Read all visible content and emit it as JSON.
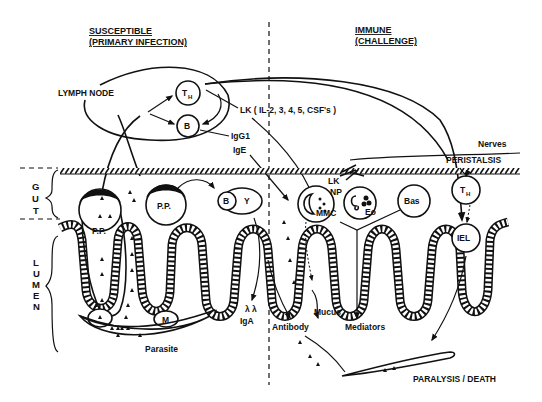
{
  "diagram": {
    "type": "immunology-schematic",
    "sections": {
      "left": {
        "title_line1": "SUSCEPTIBLE",
        "title_line2": "(PRIMARY INFECTION)"
      },
      "right": {
        "title_line1": "IMMUNE",
        "title_line2": "(CHALLENGE)"
      }
    },
    "regions": {
      "gut": {
        "letters": [
          "G",
          "U",
          "T"
        ]
      },
      "lumen": {
        "letters": [
          "L",
          "U",
          "M",
          "E",
          "N"
        ]
      }
    },
    "labels": {
      "lymph_node": "LYMPH NODE",
      "th": "T",
      "th_sub": "H",
      "b": "B",
      "lk_cytokines": "LK ( IL-2, 3, 4, 5, CSF's )",
      "igg1": "IgG1",
      "ige": "IgE",
      "nerves": "Nerves",
      "peristalsis": "PERISTALSIS",
      "pp": "P.P.",
      "m": "M",
      "lk": "LK",
      "np": "NP",
      "mmc": "MMC",
      "eo": "Eo",
      "bas": "Bas",
      "iel": "IEL",
      "iga": "IgA",
      "antibody": "Antibody",
      "mucus": "Mucus",
      "mediators": "Mediators",
      "parasite": "Parasite",
      "outcome": "PARALYSIS / DEATH"
    },
    "nodes": [
      {
        "id": "lymph-node",
        "label": "LYMPH NODE"
      },
      {
        "id": "th-node",
        "label": "TH"
      },
      {
        "id": "b-node",
        "label": "B"
      },
      {
        "id": "peyers-patch-1",
        "label": "P.P."
      },
      {
        "id": "peyers-patch-2",
        "label": "P.P."
      },
      {
        "id": "m-cell",
        "label": "M"
      },
      {
        "id": "b-gut",
        "label": "B"
      },
      {
        "id": "mast-cell",
        "label": "MMC"
      },
      {
        "id": "eosinophil",
        "label": "Eo"
      },
      {
        "id": "basophil",
        "label": "Bas"
      },
      {
        "id": "th-gut",
        "label": "TH"
      },
      {
        "id": "iel",
        "label": "IEL"
      },
      {
        "id": "parasite-left",
        "label": "Parasite"
      },
      {
        "id": "parasite-right",
        "label": "PARALYSIS / DEATH"
      }
    ],
    "edges": [
      {
        "from": "peyers-patch-1",
        "to": "lymph-node"
      },
      {
        "from": "th-node",
        "to": "b-node"
      },
      {
        "from": "th-node",
        "to": "mast-cell",
        "label": "LK ( IL-2, 3, 4, 5, CSF's )"
      },
      {
        "from": "b-node",
        "to": "lumen",
        "label": "IgG1"
      },
      {
        "from": "b-node",
        "to": "mast-cell",
        "label": "IgE"
      },
      {
        "from": "lymph-node",
        "to": "th-gut"
      },
      {
        "from": "lymph-node",
        "to": "iel"
      },
      {
        "from": "th-gut",
        "to": "iel"
      },
      {
        "from": "peyers-patch-2",
        "to": "b-gut"
      },
      {
        "from": "b-gut",
        "to": "lumen",
        "label": "IgA"
      },
      {
        "from": "mast-cell",
        "to": "lumen",
        "label": "Mucus"
      },
      {
        "from": "eosinophil",
        "to": "lumen",
        "label": "Mediators"
      },
      {
        "from": "iel",
        "to": "parasite-right"
      },
      {
        "from": "lumen",
        "to": "parasite-right",
        "label": "Antibody"
      }
    ]
  }
}
